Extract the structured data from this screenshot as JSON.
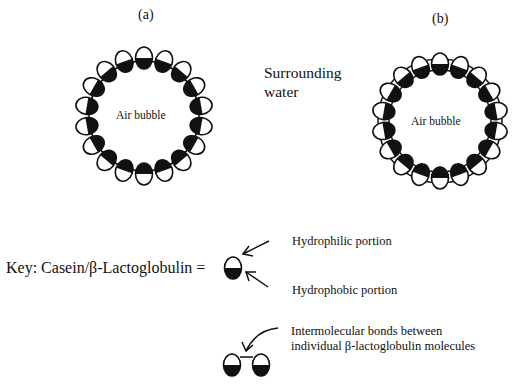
{
  "panels": [
    {
      "id": "a",
      "label": "(a)",
      "bubble_label": "Air bubble",
      "molecule_count": 18,
      "bonded": false
    },
    {
      "id": "b",
      "label": "(b)",
      "bubble_label": "Air bubble",
      "molecule_count": 18,
      "bonded": true
    }
  ],
  "medium_label": {
    "line1": "Surrounding",
    "line2": "water"
  },
  "key": {
    "prefix": "Key:  Casein/β-Lactoglobulin =",
    "hydrophilic": "Hydrophilic portion",
    "hydrophobic": "Hydrophobic portion",
    "bonds_line1": "Intermolecular bonds between",
    "bonds_line2": "individual β-lactoglobulin molecules"
  },
  "colors": {
    "ink": "#111111",
    "background": "#ffffff"
  }
}
